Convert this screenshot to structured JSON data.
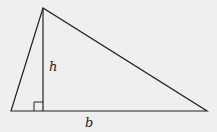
{
  "diagram": {
    "type": "triangle-area",
    "background": "#efefef",
    "stroke": "#222222",
    "vertices": {
      "apex": [
        43,
        8
      ],
      "left": [
        11,
        111
      ],
      "right": [
        207,
        111
      ]
    },
    "foot_of_altitude": [
      43,
      111
    ],
    "labels": {
      "height": "h",
      "base": "b"
    }
  }
}
